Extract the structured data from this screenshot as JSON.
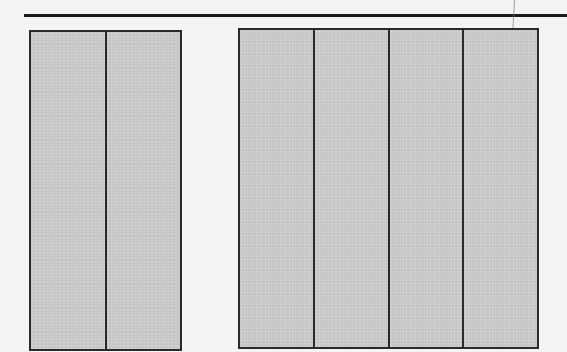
{
  "diagram": {
    "top_rule": {
      "color": "#1a1a1a"
    },
    "panel_fill": "#c8c8c8",
    "border_color": "#2a2a2a",
    "background": "#f4f4f4",
    "groups": [
      {
        "name": "left-group",
        "panel_count": 2,
        "panels": [
          "",
          ""
        ]
      },
      {
        "name": "right-group",
        "panel_count": 4,
        "panels": [
          "",
          "",
          "",
          ""
        ]
      }
    ]
  }
}
